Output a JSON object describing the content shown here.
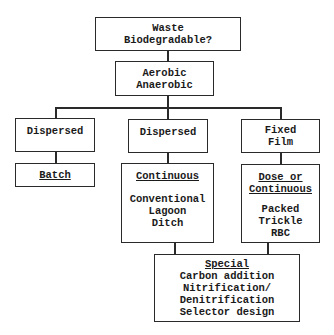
{
  "diagram": {
    "nodes": {
      "root": {
        "lines": [
          "Waste",
          "Biodegradable?"
        ]
      },
      "metabolism": {
        "lines": [
          "Aerobic",
          "Anaerobic"
        ]
      },
      "dispersed_left": {
        "lines": [
          "Dispersed"
        ]
      },
      "batch": {
        "heading": "Batch"
      },
      "dispersed_mid": {
        "lines": [
          "Dispersed"
        ]
      },
      "continuous": {
        "heading": "Continuous",
        "lines": [
          "Conventional",
          "Lagoon",
          "Ditch"
        ]
      },
      "fixed_film": {
        "lines": [
          "Fixed",
          "Film"
        ]
      },
      "dose_or_continuous": {
        "heading_lines": [
          "Dose or",
          "Continuous"
        ],
        "lines": [
          "Packed",
          "Trickle",
          "RBC"
        ]
      },
      "special": {
        "heading": "Special",
        "lines": [
          "Carbon addition",
          "Nitrification/",
          "Denitrification",
          "Selector design"
        ]
      }
    },
    "edges": [
      [
        "root",
        "metabolism"
      ],
      [
        "metabolism",
        "dispersed_left"
      ],
      [
        "metabolism",
        "dispersed_mid"
      ],
      [
        "metabolism",
        "fixed_film"
      ],
      [
        "dispersed_left",
        "batch"
      ],
      [
        "dispersed_mid",
        "continuous"
      ],
      [
        "fixed_film",
        "dose_or_continuous"
      ],
      [
        "continuous",
        "special"
      ],
      [
        "dose_or_continuous",
        "special"
      ]
    ]
  }
}
